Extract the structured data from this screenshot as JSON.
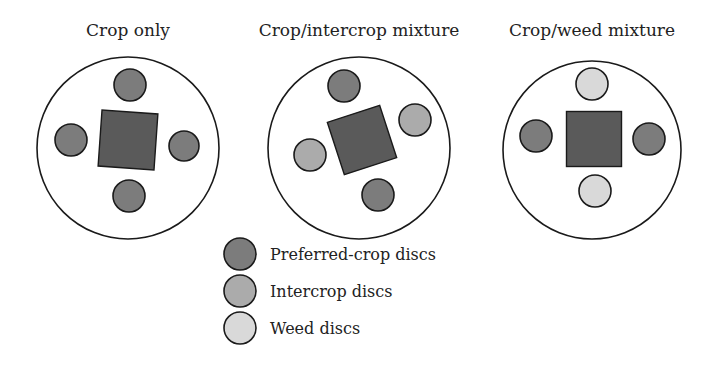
{
  "colors": {
    "square": "#5a5a5a",
    "preferred_crop": "#7c7c7c",
    "intercrop": "#ababab",
    "weed": "#d9d9d9"
  },
  "panels": [
    {
      "title": "Crop only",
      "cx": 128,
      "cy": 148,
      "r": 91,
      "square": {
        "cx": 128,
        "cy": 140,
        "size": 56,
        "rotate": 4
      },
      "discs": [
        {
          "type": "preferred_crop",
          "cx": 130,
          "cy": 85,
          "r": 16
        },
        {
          "type": "preferred_crop",
          "cx": 71,
          "cy": 140,
          "r": 16
        },
        {
          "type": "preferred_crop",
          "cx": 184,
          "cy": 146,
          "r": 15
        },
        {
          "type": "preferred_crop",
          "cx": 129,
          "cy": 196,
          "r": 16
        }
      ]
    },
    {
      "title": "Crop/intercrop mixture",
      "cx": 359,
      "cy": 148,
      "r": 91,
      "square": {
        "cx": 362,
        "cy": 140,
        "size": 55,
        "rotate": -18
      },
      "discs": [
        {
          "type": "preferred_crop",
          "cx": 344,
          "cy": 86,
          "r": 16
        },
        {
          "type": "intercrop",
          "cx": 415,
          "cy": 120,
          "r": 16
        },
        {
          "type": "intercrop",
          "cx": 310,
          "cy": 155,
          "r": 16
        },
        {
          "type": "preferred_crop",
          "cx": 378,
          "cy": 195,
          "r": 16
        }
      ]
    },
    {
      "title": "Crop/weed mixture",
      "cx": 592,
      "cy": 150,
      "r": 89,
      "square": {
        "cx": 594,
        "cy": 139,
        "size": 55,
        "rotate": 0
      },
      "discs": [
        {
          "type": "weed",
          "cx": 592,
          "cy": 84,
          "r": 16
        },
        {
          "type": "preferred_crop",
          "cx": 536,
          "cy": 136,
          "r": 16
        },
        {
          "type": "preferred_crop",
          "cx": 649,
          "cy": 139,
          "r": 16
        },
        {
          "type": "weed",
          "cx": 595,
          "cy": 191,
          "r": 16
        }
      ]
    }
  ],
  "legend": {
    "items": [
      {
        "type": "preferred_crop",
        "label": "Preferred-crop discs",
        "cx": 240,
        "cy": 254
      },
      {
        "type": "intercrop",
        "label": "Intercrop discs",
        "cx": 240,
        "cy": 291
      },
      {
        "type": "weed",
        "label": "Weed discs",
        "cx": 240,
        "cy": 328
      }
    ],
    "disc_r": 16,
    "label_x": 270
  }
}
